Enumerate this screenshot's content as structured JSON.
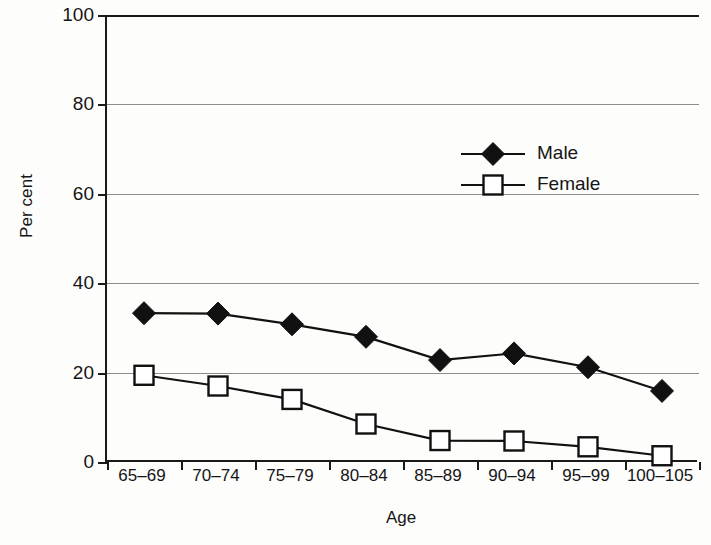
{
  "chart_data": {
    "type": "line",
    "title": "",
    "xlabel": "Age",
    "ylabel": "Per cent",
    "categories": [
      "65–69",
      "70–74",
      "75–79",
      "80–84",
      "85–89",
      "90–94",
      "95–99",
      "100–105"
    ],
    "ylim": [
      0,
      100
    ],
    "yticks": [
      0,
      20,
      40,
      60,
      80,
      100
    ],
    "ytick_labels": [
      "0",
      "20",
      "40",
      "60",
      "80",
      "100"
    ],
    "grid": true,
    "grid_axis": "y",
    "legend_position": "upper-center",
    "series": [
      {
        "name": "Male",
        "marker": "filled-diamond",
        "color": "#111111",
        "values": [
          33.3,
          33.2,
          30.8,
          28.0,
          22.8,
          24.3,
          21.2,
          15.9
        ]
      },
      {
        "name": "Female",
        "marker": "open-square",
        "color": "#111111",
        "values": [
          19.4,
          17.0,
          14.0,
          8.5,
          4.8,
          4.7,
          3.4,
          1.4
        ]
      }
    ]
  },
  "legend": {
    "items": [
      {
        "label": "Male",
        "marker": "filled-diamond"
      },
      {
        "label": "Female",
        "marker": "open-square"
      }
    ]
  },
  "axes": {
    "y_title": "Per cent",
    "x_title": "Age"
  }
}
